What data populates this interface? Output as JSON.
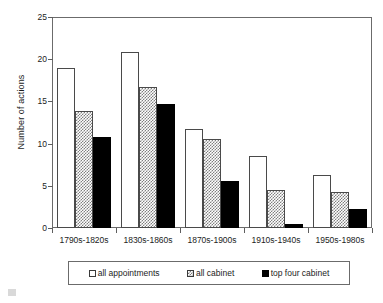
{
  "chart_data": {
    "type": "bar",
    "title": "",
    "xlabel": "",
    "ylabel": "Number of actions",
    "ylim": [
      0,
      25
    ],
    "yticks": [
      0,
      5,
      10,
      15,
      20,
      25
    ],
    "ytick_labels": [
      "0",
      "5",
      "10",
      "15",
      "20",
      "25"
    ],
    "grid": false,
    "legend_position": "bottom",
    "categories": [
      "1790s-1820s",
      "1830s-1860s",
      "1870s-1900s",
      "1910s-1940s",
      "1950s-1980s"
    ],
    "series": [
      {
        "name": "all appointments",
        "color": "#ffffff",
        "pattern": "solid-white",
        "values": [
          19.0,
          20.8,
          11.7,
          8.5,
          6.3
        ]
      },
      {
        "name": "all cabinet",
        "color": "#808080",
        "pattern": "checker-hatch",
        "values": [
          13.9,
          16.7,
          10.6,
          4.5,
          4.3
        ]
      },
      {
        "name": "top four cabinet",
        "color": "#000000",
        "pattern": "solid-black",
        "values": [
          10.8,
          14.7,
          5.6,
          0.5,
          2.3
        ]
      }
    ]
  },
  "axis": {
    "y_title": "Number of actions"
  },
  "legend": {
    "entries": [
      {
        "label": "all appointments"
      },
      {
        "label": "all cabinet"
      },
      {
        "label": "top four cabinet"
      }
    ]
  }
}
